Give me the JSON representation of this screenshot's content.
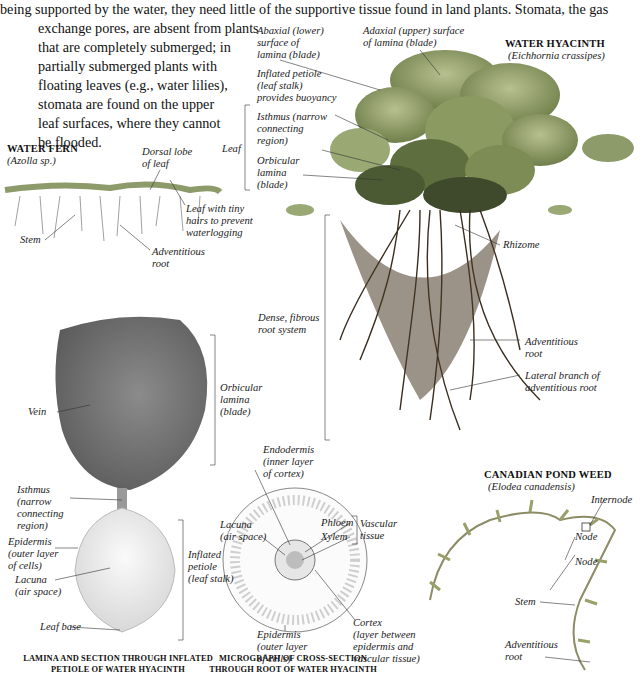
{
  "intro_lines": [
    "being supported by the water, they need little of the supportive tissue found in land plants. Stomata, the gas",
    "exchange pores, are absent from plants",
    "that are completely submerged; in",
    "partially submerged plants with",
    "floating leaves (e.g., water lilies),",
    "stomata are found on the upper",
    "leaf surfaces, where they cannot",
    "be flooded."
  ],
  "water_hyacinth": {
    "title": "WATER HYACINTH",
    "species": "(Eichhornia crassipes)",
    "labels": {
      "abaxial": [
        "Abaxial (lower)",
        "surface of",
        "lamina (blade)"
      ],
      "adaxial": [
        "Adaxial (upper) surface",
        "of lamina (blade)"
      ],
      "inflated_petiole": [
        "Inflated petiole",
        "(leaf stalk)",
        "provides buoyancy"
      ],
      "leaf": "Leaf",
      "isthmus": [
        "Isthmus (narrow",
        "connecting",
        "region)"
      ],
      "orbicular_lamina": [
        "Orbicular",
        "lamina",
        "(blade)"
      ],
      "rhizome": "Rhizome",
      "dense_root": [
        "Dense, fibrous",
        "root system"
      ],
      "adventitious_root": [
        "Adventitious",
        "root"
      ],
      "lateral_branch": [
        "Lateral branch of",
        "adventitious root"
      ]
    }
  },
  "water_fern": {
    "title": "WATER FERN",
    "species": "(Azolla sp.)",
    "labels": {
      "dorsal_lobe": [
        "Dorsal lobe",
        "of leaf"
      ],
      "leaf_hairs": [
        "Leaf with tiny",
        "hairs to prevent",
        "waterlogging"
      ],
      "stem": "Stem",
      "adventitious_root": [
        "Adventitious",
        "root"
      ]
    }
  },
  "lamina_section": {
    "labels": {
      "orbicular_lamina": [
        "Orbicular",
        "lamina",
        "(blade)"
      ],
      "vein": "Vein",
      "isthmus": [
        "Isthmus",
        "(narrow",
        "connecting",
        "region)"
      ],
      "epidermis": [
        "Epidermis",
        "(outer layer",
        "of cells)"
      ],
      "lacuna": [
        "Lacuna",
        "(air space)"
      ],
      "inflated_petiole": [
        "Inflated",
        "petiole",
        "(leaf stalk)"
      ],
      "leaf_base": "Leaf base"
    },
    "caption": [
      "LAMINA AND SECTION THROUGH INFLATED",
      "PETIOLE OF WATER HYACINTH"
    ]
  },
  "micrograph": {
    "labels": {
      "endodermis": [
        "Endodermis",
        "(inner layer",
        "of cortex)"
      ],
      "lacuna": [
        "Lacuna",
        "(air space)"
      ],
      "phloem": "Phloem",
      "xylem": "Xylem",
      "vascular_tissue": [
        "Vascular",
        "tissue"
      ],
      "epidermis": [
        "Epidermis",
        "(outer layer",
        "of cells)"
      ],
      "cortex": [
        "Cortex",
        "(layer between",
        "epidermis and",
        "vascular tissue)"
      ]
    },
    "caption": [
      "MICROGRAPH OF CROSS-SECTION",
      "THROUGH ROOT OF WATER HYACINTH"
    ]
  },
  "pond_weed": {
    "title": "CANADIAN POND WEED",
    "species": "(Elodea canadensis)",
    "labels": {
      "internode": "Internode",
      "node1": "Node",
      "node2": "Node",
      "stem": "Stem",
      "adventitious_root": [
        "Adventitious",
        "root"
      ]
    }
  },
  "colors": {
    "leaf_green": "#7f8f58",
    "leaf_dark": "#4b5a33",
    "root_brown": "#4a3a26",
    "lamina_gray": "#6f6f6f",
    "petiole_light": "#ececec",
    "line": "#333333"
  }
}
